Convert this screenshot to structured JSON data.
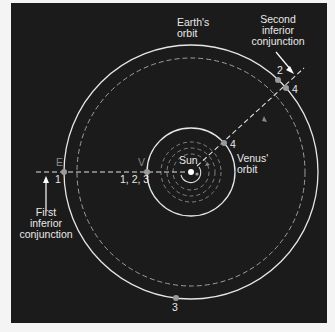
{
  "diagram": {
    "labels": {
      "earths_orbit": "Earth's\norbit",
      "venus_orbit": "Venus'\norbit",
      "sun": "Sun",
      "second_inferior_conjunction": "Second\ninferior\nconjunction",
      "first_inferior_conjunction": "First\ninferior\nconjunction",
      "earth_marker": "E",
      "venus_marker": "V",
      "earth_pos_1": "1",
      "venus_pos_123": "1, 2, 3",
      "earth_pos_2": "2",
      "earth_pos_4": "4",
      "venus_pos_4": "4",
      "earth_pos_3": "3"
    },
    "colors": {
      "background": "#1b1b1b",
      "orbit_line": "#e6e6e6",
      "dashed_line": "#bdbdbd",
      "point": "#9a9a9a",
      "page": "#f4f4f4"
    }
  }
}
